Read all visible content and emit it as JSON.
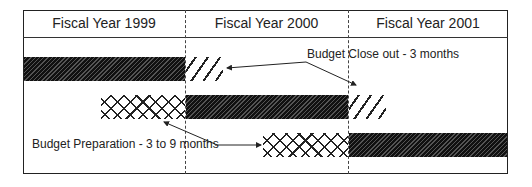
{
  "headers": [
    "Fiscal Year 1999",
    "Fiscal Year 2000",
    "Fiscal Year 2001"
  ],
  "annotations": {
    "close_out": "Budget Close out - 3 months",
    "preparation": "Budget Preparation - 3 to 9 months"
  },
  "rows": [
    {
      "fiscal_year": "1999",
      "preparation": "Fiscal Year 1998-1999 (partial)",
      "execution": "Fiscal Year 1999",
      "close_out": "first 3 months of Fiscal Year 2000"
    },
    {
      "fiscal_year": "2000",
      "preparation": "last ~6 months of Fiscal Year 1999",
      "execution": "Fiscal Year 2000",
      "close_out": "first 3 months of Fiscal Year 2001"
    },
    {
      "fiscal_year": "2001",
      "preparation": "last ~6 months of Fiscal Year 2000",
      "execution": "Fiscal Year 2001"
    }
  ],
  "legend": {
    "solid_hatch": "Budget execution",
    "light_hatch": "Budget close out",
    "crosshatch": "Budget preparation"
  }
}
